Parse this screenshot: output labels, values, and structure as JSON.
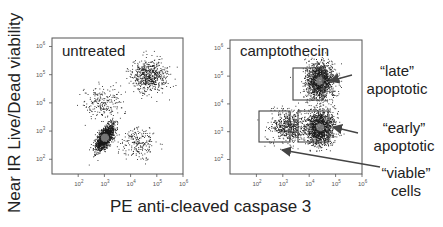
{
  "figure": {
    "ylabel": "Near IR Live/Dead viability",
    "xlabel": "PE anti-cleaved caspase 3"
  },
  "panels": [
    {
      "title": "untreated"
    },
    {
      "title": "camptothecin"
    }
  ],
  "annotations": {
    "late": {
      "line1": "“late”",
      "line2": "apoptotic"
    },
    "early": {
      "line1": "“early”",
      "line2": "apoptotic"
    },
    "viable": {
      "line1": "“viable”",
      "line2": "cells"
    }
  },
  "colors": {
    "axis": "#555555",
    "dots": "#1a1a1a",
    "gate": "#444444",
    "arrow": "#444444"
  },
  "chart_data": [
    {
      "type": "scatter",
      "title": "untreated",
      "xlabel": "PE anti-cleaved caspase 3",
      "ylabel": "Near IR Live/Dead viability",
      "xscale": "log",
      "yscale": "log",
      "xlim": [
        10,
        1000000
      ],
      "ylim": [
        30,
        2000000
      ],
      "xticks": [
        "10^2",
        "10^3",
        "10^4",
        "10^5",
        "10^6"
      ],
      "yticks": [
        "10^2",
        "10^3",
        "10^4",
        "10^5",
        "10^6"
      ],
      "populations": [
        {
          "name": "viable (dense)",
          "x_center": 1000,
          "y_center": 600,
          "density": "high"
        },
        {
          "name": "late apoptotic",
          "x_center": 50000,
          "y_center": 90000,
          "density": "medium"
        },
        {
          "name": "early apoptotic",
          "x_center": 20000,
          "y_center": 400,
          "density": "low"
        },
        {
          "name": "Live/Dead+ caspase-",
          "x_center": 800,
          "y_center": 10000,
          "density": "low"
        }
      ]
    },
    {
      "type": "scatter",
      "title": "camptothecin",
      "xlabel": "PE anti-cleaved caspase 3",
      "ylabel": "Near IR Live/Dead viability",
      "xscale": "log",
      "yscale": "log",
      "xlim": [
        10,
        1000000
      ],
      "ylim": [
        30,
        2000000
      ],
      "xticks": [
        "10^2",
        "10^3",
        "10^4",
        "10^5",
        "10^6"
      ],
      "yticks": [
        "10^2",
        "10^3",
        "10^4",
        "10^5",
        "10^6"
      ],
      "gates": [
        {
          "name": "late apoptotic",
          "x": [
            8000,
            80000
          ],
          "y": [
            15000,
            250000
          ]
        },
        {
          "name": "viable cells",
          "x": [
            300,
            5000
          ],
          "y": [
            400,
            6000
          ]
        },
        {
          "name": "early apoptotic",
          "x": [
            10000,
            120000
          ],
          "y": [
            400,
            6000
          ]
        }
      ],
      "populations": [
        {
          "name": "late apoptotic",
          "x_center": 25000,
          "y_center": 70000,
          "density": "high"
        },
        {
          "name": "viable cells",
          "x_center": 1500,
          "y_center": 1500,
          "density": "medium"
        },
        {
          "name": "early apoptotic",
          "x_center": 25000,
          "y_center": 1500,
          "density": "high"
        }
      ]
    }
  ]
}
